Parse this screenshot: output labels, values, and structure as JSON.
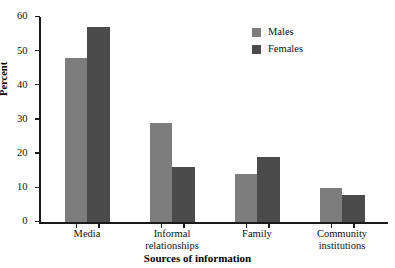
{
  "caption": {
    "clipped_text": "A"
  },
  "chart_data": {
    "type": "bar",
    "title": "",
    "xlabel": "Sources of information",
    "ylabel": "Percent",
    "categories": [
      "Media",
      "Informal relationships",
      "Family",
      "Community institutions"
    ],
    "category_lines": [
      [
        "Media"
      ],
      [
        "Informal",
        "relationships"
      ],
      [
        "Family"
      ],
      [
        "Community",
        "institutions"
      ]
    ],
    "series": [
      {
        "name": "Males",
        "color": "#7d7d7d",
        "values": [
          48,
          29,
          14,
          10
        ]
      },
      {
        "name": "Females",
        "color": "#4b4b4b",
        "values": [
          57,
          16,
          19,
          8
        ]
      }
    ],
    "ylim": [
      0,
      60
    ],
    "yticks": [
      0,
      10,
      20,
      30,
      40,
      50,
      60
    ],
    "ytick_labels": [
      "0",
      "10",
      "20",
      "30",
      "40",
      "50",
      "60"
    ],
    "grid": false,
    "legend_position": "top-right"
  },
  "legend": {
    "entries": [
      {
        "label": "Males"
      },
      {
        "label": "Females"
      }
    ]
  }
}
